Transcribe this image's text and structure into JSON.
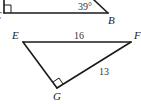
{
  "figure": {
    "top_triangle": {
      "vertex_labels": {
        "left": "C",
        "right": "B"
      },
      "angle_label": "39°",
      "right_angle_vertex": "C"
    },
    "bottom_triangle": {
      "vertex_labels": {
        "E": "E",
        "F": "F",
        "G": "G"
      },
      "side_labels": {
        "EF": "16",
        "FG": "13"
      },
      "right_angle_vertex": "G"
    }
  }
}
